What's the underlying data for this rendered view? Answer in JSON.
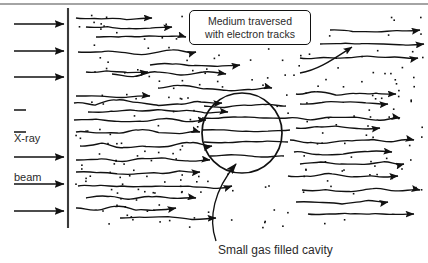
{
  "figure": {
    "kind": "physics-diagram"
  },
  "labels": {
    "beam_line1": "X-ray",
    "beam_line2": "beam",
    "medium_line1": "Medium traversed",
    "medium_line2": "with electron tracks",
    "cavity_caption": "Small gas filled cavity"
  },
  "colors": {
    "ink": "#111111",
    "text": "#2b2b2b",
    "background": "#ffffff",
    "boundary": "#3a3a3a"
  },
  "geometry": {
    "width": 428,
    "height": 263,
    "boundary_line": {
      "x": 68,
      "y1": 8,
      "y2": 228
    },
    "top_border": {
      "y": 4,
      "x1": 0,
      "x2": 428
    },
    "cavity_circle": {
      "cx": 242,
      "cy": 133,
      "r": 40
    },
    "medium_region": {
      "x1": 72,
      "y1": 8,
      "x2": 428,
      "y2": 232
    }
  },
  "beam_arrows": {
    "count": 6,
    "x_start": 14,
    "x_end": 68,
    "rows": [
      24,
      51,
      77,
      157,
      184,
      211
    ],
    "stub_rows": [
      110,
      132
    ],
    "stub_x_start": 14,
    "stub_x_end": 26
  },
  "electron_tracks": {
    "count": 34,
    "style": "wavy-horizontal-with-right-arrowhead",
    "paths": [
      {
        "y": 18,
        "x1": 76,
        "x2": 152,
        "amp": 2.4
      },
      {
        "y": 27,
        "x1": 86,
        "x2": 172,
        "amp": 2.0
      },
      {
        "y": 37,
        "x1": 96,
        "x2": 186,
        "amp": 2.6
      },
      {
        "y": 52,
        "x1": 78,
        "x2": 196,
        "amp": 3.0
      },
      {
        "y": 65,
        "x1": 150,
        "x2": 240,
        "amp": 2.2
      },
      {
        "y": 72,
        "x1": 86,
        "x2": 148,
        "amp": 2.0
      },
      {
        "y": 74,
        "x1": 112,
        "x2": 226,
        "amp": 2.6
      },
      {
        "y": 88,
        "x1": 158,
        "x2": 272,
        "amp": 2.4
      },
      {
        "y": 96,
        "x1": 76,
        "x2": 150,
        "amp": 2.2
      },
      {
        "y": 103,
        "x1": 74,
        "x2": 222,
        "amp": 3.0
      },
      {
        "y": 112,
        "x1": 88,
        "x2": 228,
        "amp": 2.4
      },
      {
        "y": 120,
        "x1": 74,
        "x2": 206,
        "amp": 2.2
      },
      {
        "y": 132,
        "x1": 76,
        "x2": 200,
        "amp": 2.6
      },
      {
        "y": 146,
        "x1": 80,
        "x2": 212,
        "amp": 3.2
      },
      {
        "y": 160,
        "x1": 76,
        "x2": 210,
        "amp": 2.4
      },
      {
        "y": 172,
        "x1": 76,
        "x2": 200,
        "amp": 2.0
      },
      {
        "y": 186,
        "x1": 78,
        "x2": 232,
        "amp": 2.8
      },
      {
        "y": 198,
        "x1": 86,
        "x2": 196,
        "amp": 2.2
      },
      {
        "y": 208,
        "x1": 76,
        "x2": 176,
        "amp": 2.4
      },
      {
        "y": 218,
        "x1": 120,
        "x2": 216,
        "amp": 2.0
      },
      {
        "y": 94,
        "x1": 296,
        "x2": 396,
        "amp": 2.4
      },
      {
        "y": 104,
        "x1": 300,
        "x2": 388,
        "amp": 2.6
      },
      {
        "y": 118,
        "x1": 288,
        "x2": 400,
        "amp": 2.2
      },
      {
        "y": 128,
        "x1": 296,
        "x2": 380,
        "amp": 2.0
      },
      {
        "y": 140,
        "x1": 290,
        "x2": 414,
        "amp": 2.6
      },
      {
        "y": 152,
        "x1": 294,
        "x2": 392,
        "amp": 2.4
      },
      {
        "y": 164,
        "x1": 300,
        "x2": 404,
        "amp": 2.2
      },
      {
        "y": 176,
        "x1": 288,
        "x2": 398,
        "amp": 2.8
      },
      {
        "y": 190,
        "x1": 302,
        "x2": 420,
        "amp": 2.2
      },
      {
        "y": 202,
        "x1": 296,
        "x2": 388,
        "amp": 2.4
      },
      {
        "y": 214,
        "x1": 308,
        "x2": 414,
        "amp": 2.0
      },
      {
        "y": 58,
        "x1": 300,
        "x2": 418,
        "amp": 2.6
      },
      {
        "y": 44,
        "x1": 320,
        "x2": 424,
        "amp": 2.2
      },
      {
        "y": 30,
        "x1": 330,
        "x2": 420,
        "amp": 2.0
      }
    ],
    "cavity_internal": [
      {
        "y": 106,
        "x1": 204,
        "x2": 286
      },
      {
        "y": 118,
        "x1": 202,
        "x2": 288
      },
      {
        "y": 130,
        "x1": 202,
        "x2": 290
      },
      {
        "y": 142,
        "x1": 204,
        "x2": 288
      },
      {
        "y": 156,
        "x1": 210,
        "x2": 284
      }
    ],
    "crossing_track": {
      "x1": 300,
      "y1": 72,
      "x2": 352,
      "y2": 46
    }
  },
  "leader_line": {
    "from": {
      "x": 216,
      "y": 240
    },
    "to": {
      "x": 238,
      "y": 162
    },
    "arrowhead": "up-left-into-circle"
  },
  "dots": {
    "count": 220,
    "size_px": 1.6,
    "color": "#111111",
    "note": "randomly scattered through the medium, absent inside the cavity circle"
  }
}
